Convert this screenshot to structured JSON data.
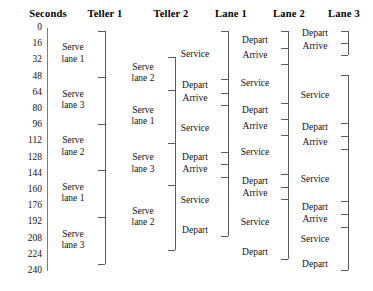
{
  "diagram": {
    "width": 373,
    "height": 291,
    "line_color": "#5a5a5a",
    "axis_color": "#7c7c7c",
    "text_color": "#111111"
  },
  "columns": [
    {
      "key": "seconds",
      "header": "Seconds",
      "header_x": 12,
      "header_width": 72
    },
    {
      "key": "teller1",
      "header": "Teller 1",
      "header_x": 74,
      "header_width": 62
    },
    {
      "key": "teller2",
      "header": "Teller 2",
      "header_x": 140,
      "header_width": 62
    },
    {
      "key": "lane1",
      "header": "Lane 1",
      "header_x": 202,
      "header_width": 58
    },
    {
      "key": "lane2",
      "header": "Lane 2",
      "header_x": 260,
      "header_width": 58
    },
    {
      "key": "lane3",
      "header": "Lane 3",
      "header_x": 316,
      "header_width": 56
    }
  ],
  "axis": {
    "name": "seconds-axis",
    "unit": "Seconds",
    "min": 0,
    "max": 240,
    "step": 16,
    "ticks": [
      0,
      16,
      32,
      48,
      64,
      80,
      96,
      112,
      128,
      144,
      160,
      176,
      192,
      208,
      224,
      240
    ],
    "tick_labels": [
      "0",
      "16",
      "32",
      "48",
      "64",
      "80",
      "96",
      "112",
      "128",
      "144",
      "160",
      "176",
      "192",
      "208",
      "224",
      "240"
    ],
    "line_x": 47,
    "line_top": 28,
    "line_bottom": 271,
    "label_right": 42,
    "top_y": 28,
    "pixels_per_step": 16.2
  },
  "teller1": {
    "name": "teller-1-track",
    "spine_x": 105,
    "top": 31,
    "bottom": 264,
    "ticks": [
      31,
      77,
      124,
      170,
      217,
      264
    ],
    "segments": [
      {
        "line1": "Serve",
        "line2": "lane 1",
        "start": 31,
        "end": 77
      },
      {
        "line1": "Serve",
        "line2": "lane 3",
        "start": 77,
        "end": 124
      },
      {
        "line1": "Serve",
        "line2": "lane 2",
        "start": 124,
        "end": 170
      },
      {
        "line1": "Serve",
        "line2": "lane 1",
        "start": 170,
        "end": 217
      },
      {
        "line1": "Serve",
        "line2": "lane 3",
        "start": 217,
        "end": 264
      }
    ]
  },
  "teller2": {
    "name": "teller-2-track",
    "spine_x": 175,
    "top": 57,
    "bottom": 250,
    "ticks": [
      57,
      90,
      143,
      185,
      250
    ],
    "segments": [
      {
        "line1": "Serve",
        "line2": "lane 2",
        "start": 57,
        "end": 90
      },
      {
        "line1": "Serve",
        "line2": "lane 1",
        "start": 90,
        "end": 143
      },
      {
        "line1": "Serve",
        "line2": "lane 3",
        "start": 143,
        "end": 185
      },
      {
        "line1": "Serve",
        "line2": "lane 2",
        "start": 185,
        "end": 250
      }
    ]
  },
  "lane1": {
    "name": "lane-1-track",
    "spine_x": 228,
    "top": 31,
    "bottom": 236,
    "ticks": [
      31,
      79,
      93,
      105,
      152,
      164,
      177,
      236
    ],
    "events": [
      {
        "label": "Service",
        "y": 55
      },
      {
        "label": "Depart",
        "y": 86
      },
      {
        "label": "Arrive",
        "y": 99
      },
      {
        "label": "Service",
        "y": 129
      },
      {
        "label": "Depart",
        "y": 158
      },
      {
        "label": "Arrive",
        "y": 170
      },
      {
        "label": "Service",
        "y": 201
      },
      {
        "label": "Depart",
        "y": 231
      }
    ]
  },
  "lane2": {
    "name": "lane-2-track",
    "spine_x": 288,
    "top": 31,
    "bottom": 259,
    "ticks": [
      31,
      48,
      64,
      103,
      119,
      135,
      174,
      187,
      199,
      259
    ],
    "events": [
      {
        "label": "Depart",
        "y": 41
      },
      {
        "label": "Arrive",
        "y": 56
      },
      {
        "label": "Service",
        "y": 84
      },
      {
        "label": "Depart",
        "y": 111
      },
      {
        "label": "Arrive",
        "y": 127
      },
      {
        "label": "Service",
        "y": 153
      },
      {
        "label": "Depart",
        "y": 182
      },
      {
        "label": "Arrive",
        "y": 194
      },
      {
        "label": "Service",
        "y": 223
      },
      {
        "label": "Depart",
        "y": 253
      }
    ]
  },
  "lane3": {
    "name": "lane-3-track",
    "spine_x": 348,
    "brackets": [
      {
        "top": 31,
        "bottom": 55,
        "ticks": [
          31,
          43,
          55
        ]
      },
      {
        "top": 75,
        "bottom": 270,
        "ticks": [
          75,
          123,
          136,
          149,
          201,
          214,
          227,
          270
        ]
      }
    ],
    "events": [
      {
        "label": "Depart",
        "y": 34
      },
      {
        "label": "Arrive",
        "y": 47
      },
      {
        "label": "Service",
        "y": 96
      },
      {
        "label": "Depart",
        "y": 128
      },
      {
        "label": "Arrive",
        "y": 143
      },
      {
        "label": "Service",
        "y": 180
      },
      {
        "label": "Depart",
        "y": 208
      },
      {
        "label": "Arrive",
        "y": 220
      },
      {
        "label": "Service",
        "y": 240
      },
      {
        "label": "Depart",
        "y": 265
      }
    ]
  }
}
